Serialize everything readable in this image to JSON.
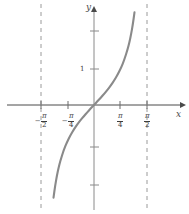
{
  "figure": {
    "title": "",
    "width": 189,
    "height": 214,
    "background_color": "#ffffff"
  },
  "axes": {
    "x_name": "x",
    "y_name": "y",
    "axis_color": "#4a4a4a",
    "origin_px": {
      "x": 94,
      "y": 105
    }
  },
  "chart_data": {
    "type": "line",
    "function": "y = tan(x)",
    "title": "",
    "xlabel": "x",
    "ylabel": "y",
    "xlim": [
      -1.9634954,
      1.9634954
    ],
    "ylim": [
      -2.75,
      2.75
    ],
    "grid": false,
    "legend": null,
    "curve_color": "#8a8a8a",
    "asymptote_color": "#9a9a9a",
    "asymptotes": [
      {
        "label": "-pi/2",
        "x": -1.5707963
      },
      {
        "label": "pi/2",
        "x": 1.5707963
      }
    ],
    "x_ticks": [
      {
        "x": -1.5707963,
        "label_sign": "−",
        "numerator": "π",
        "denominator": "2"
      },
      {
        "x": -0.7853982,
        "label_sign": "−",
        "numerator": "π",
        "denominator": "4"
      },
      {
        "x": 0.7853982,
        "label_sign": "",
        "numerator": "π",
        "denominator": "4"
      },
      {
        "x": 1.5707963,
        "label_sign": "",
        "numerator": "π",
        "denominator": "2"
      }
    ],
    "y_ticks": [
      {
        "y": 2,
        "label": ""
      },
      {
        "y": 1,
        "label": "1"
      },
      {
        "y": -1,
        "label": ""
      },
      {
        "y": -2,
        "label": ""
      }
    ],
    "x": [
      -1.4,
      -1.35,
      -1.3,
      -1.25,
      -1.2,
      -1.15,
      -1.1,
      -1.05,
      -1.0,
      -0.9,
      -0.8,
      -0.7,
      -0.6,
      -0.5,
      -0.4,
      -0.3,
      -0.2,
      -0.1,
      0.0,
      0.1,
      0.2,
      0.3,
      0.4,
      0.5,
      0.6,
      0.7,
      0.8,
      0.9,
      1.0,
      1.05,
      1.1,
      1.15,
      1.2,
      1.25,
      1.3,
      1.35,
      1.4
    ],
    "y": [
      -5.798,
      -4.455,
      -3.602,
      -3.01,
      -2.572,
      -2.234,
      -1.965,
      -1.743,
      -1.557,
      -1.26,
      -1.03,
      -0.842,
      -0.684,
      -0.546,
      -0.423,
      -0.309,
      -0.203,
      -0.1,
      0.0,
      0.1,
      0.203,
      0.309,
      0.423,
      0.546,
      0.684,
      0.842,
      1.03,
      1.26,
      1.557,
      1.743,
      1.965,
      2.234,
      2.572,
      3.01,
      3.602,
      4.455,
      5.798
    ]
  }
}
